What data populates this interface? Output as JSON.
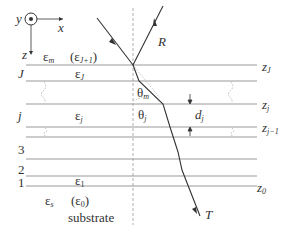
{
  "diagram": {
    "type": "multilayer-stack-ray-diagram",
    "axes": {
      "y_label": "y",
      "x_label": "x",
      "z_label": "z"
    },
    "ambient": {
      "eps_label": "ε",
      "eps_sub": "m",
      "alt_label": "(ε",
      "alt_sub": "J+1",
      "alt_close": ")"
    },
    "layers": [
      {
        "index_label": "J",
        "eps": "ε",
        "eps_sub": "J",
        "z_label": "z",
        "z_sub": "J"
      },
      {
        "index_label": "j",
        "eps": "ε",
        "eps_sub": "j",
        "z_label": "z",
        "z_sub": "j",
        "z_lower_label": "z",
        "z_lower_sub": "j−1",
        "thickness_label": "d",
        "thickness_sub": "j"
      },
      {
        "index_label": "3"
      },
      {
        "index_label": "2"
      },
      {
        "index_label": "1",
        "eps": "ε",
        "eps_sub": "1",
        "z_label": "z",
        "z_sub": "0"
      }
    ],
    "substrate": {
      "eps": "ε",
      "eps_sub": "s",
      "alt": "(ε",
      "alt_sub": "0",
      "alt_close": ")",
      "label": "substrate"
    },
    "angles": {
      "theta_m": "θ",
      "theta_m_sub": "m",
      "theta_j": "θ",
      "theta_j_sub": "j"
    },
    "rays": {
      "reflected": "R",
      "transmitted": "T"
    },
    "colors": {
      "line": "#999999",
      "ray": "#333333",
      "text": "#333333"
    }
  }
}
